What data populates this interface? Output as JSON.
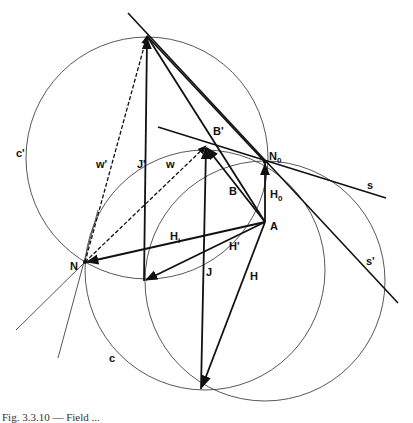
{
  "figure": {
    "caption": "Fig. 3.3.10 — Field ...",
    "colors": {
      "ink": "#111111",
      "thin": "#444444",
      "background": "#ffffff"
    }
  },
  "points": {
    "T": {
      "x": 147,
      "y": 36
    },
    "N": {
      "label": "N",
      "x": 85,
      "y": 262
    },
    "N0": {
      "label": "N",
      "sub": "0",
      "x": 265,
      "y": 162
    },
    "A": {
      "label": "A",
      "x": 265,
      "y": 222
    },
    "Bp_tip": {
      "x": 206,
      "y": 146
    },
    "P": {
      "x": 201,
      "y": 389
    },
    "Q": {
      "x": 144,
      "y": 281
    }
  },
  "circles": [
    {
      "name": "c-prime",
      "label": "c'",
      "cx": 147,
      "cy": 158,
      "r": 121
    },
    {
      "name": "c",
      "label": "c",
      "cx": 205,
      "cy": 270,
      "r": 120
    },
    {
      "name": "third",
      "label": "",
      "cx": 265,
      "cy": 281,
      "r": 120
    }
  ],
  "labels": {
    "c_prime": "c'",
    "w_prime": "w'",
    "J_prime": "J'",
    "w": "w",
    "B_prime": "B'",
    "N0_main": "N",
    "N0_sub": "0",
    "s": "s",
    "B": "B",
    "H0_main": "H",
    "H0_sub": "0",
    "A": "A",
    "H1_main": "H",
    "H1_sub": "i",
    "H_prime": "H'",
    "N": "N",
    "J": "J",
    "H": "H",
    "s_prime": "s'",
    "c": "c"
  },
  "vectors": [
    {
      "name": "J-prime",
      "from": "Q",
      "to": "T"
    },
    {
      "name": "J",
      "from": "P",
      "to": "Bp_tip"
    },
    {
      "name": "H0",
      "from": "A",
      "to": "N0"
    },
    {
      "name": "H",
      "from": "A",
      "to": "P"
    },
    {
      "name": "H1",
      "from": "A",
      "to": "N"
    },
    {
      "name": "H-prime",
      "from": "A",
      "to": "Q"
    },
    {
      "name": "B",
      "from": "A",
      "to": "Bp_tip"
    },
    {
      "name": "B-prime",
      "from": "A",
      "to": "T"
    },
    {
      "name": "w",
      "from": "N",
      "to": "Bp_tip",
      "dashed": true
    },
    {
      "name": "w-prime",
      "from": "N",
      "to": "T",
      "dashed": true
    }
  ]
}
